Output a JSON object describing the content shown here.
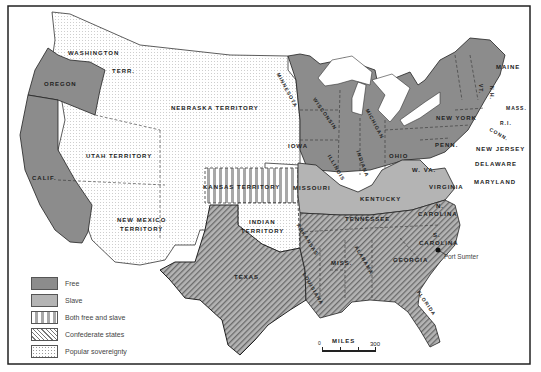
{
  "map": {
    "title": "United States 1854-1861 (Kansas-Nebraska Act era)",
    "legend": [
      {
        "key": "free",
        "label": "Free",
        "color": "#8c8c8c",
        "pattern": "solid"
      },
      {
        "key": "slave",
        "label": "Slave",
        "color": "#b4b4b4",
        "pattern": "solid"
      },
      {
        "key": "both",
        "label": "Both free and slave",
        "color": "#a8a8a8",
        "pattern": "vertical-stripes"
      },
      {
        "key": "confederate",
        "label": "Confederate states",
        "color": "#777777",
        "pattern": "diagonal-hatch"
      },
      {
        "key": "popular",
        "label": "Popular sovereignty",
        "color": "#999999",
        "pattern": "dots"
      }
    ],
    "scale": {
      "label": "MILES",
      "start": "0",
      "end": "300"
    },
    "annotation": {
      "label": "Fort Sumter"
    },
    "regions": {
      "washington": {
        "name": "WASHINGTON",
        "suffix": "TERR.",
        "status": "popular"
      },
      "oregon": {
        "name": "OREGON",
        "status": "free"
      },
      "california": {
        "name": "CALIF.",
        "status": "free"
      },
      "nebraska": {
        "name": "NEBRASKA TERRITORY",
        "status": "popular"
      },
      "utah": {
        "name": "UTAH TERRITORY",
        "status": "popular"
      },
      "new_mexico": {
        "name_line1": "NEW MEXICO",
        "name_line2": "TERRITORY",
        "status": "popular"
      },
      "kansas": {
        "name": "KANSAS TERRITORY",
        "status": "both"
      },
      "indian": {
        "name_line1": "INDIAN",
        "name_line2": "TERRITORY",
        "status": "popular"
      },
      "texas": {
        "name": "TEXAS",
        "status": "slave-confederate"
      },
      "minnesota": {
        "name": "MINNESOTA",
        "status": "free"
      },
      "iowa": {
        "name": "IOWA",
        "status": "free"
      },
      "missouri": {
        "name": "MISSOURI",
        "status": "slave"
      },
      "arkansas": {
        "name": "ARKANSAS",
        "status": "slave-confederate"
      },
      "louisiana": {
        "name": "LOUISIANA",
        "status": "slave-confederate"
      },
      "wisconsin": {
        "name": "WISCONSIN",
        "status": "free"
      },
      "illinois": {
        "name": "ILLINOIS",
        "status": "free"
      },
      "michigan": {
        "name": "MICHIGAN",
        "status": "free"
      },
      "indiana": {
        "name": "INDIANA",
        "status": "free"
      },
      "ohio": {
        "name": "OHIO",
        "status": "free"
      },
      "kentucky": {
        "name": "KENTUCKY",
        "status": "slave"
      },
      "tennessee": {
        "name": "TENNESSEE",
        "status": "slave-confederate"
      },
      "mississippi": {
        "name": "MISS.",
        "status": "slave-confederate"
      },
      "alabama": {
        "name": "ALABAMA",
        "status": "slave-confederate"
      },
      "georgia": {
        "name": "GEORGIA",
        "status": "slave-confederate"
      },
      "florida": {
        "name": "FLORIDA",
        "status": "slave-confederate"
      },
      "south_carolina": {
        "name_line1": "S.",
        "name_line2": "CAROLINA",
        "status": "slave-confederate"
      },
      "north_carolina": {
        "name_line1": "N.",
        "name_line2": "CAROLINA",
        "status": "slave-confederate"
      },
      "virginia": {
        "name": "VIRGINIA",
        "status": "slave-confederate"
      },
      "west_virginia": {
        "name": "W. VA.",
        "status": "slave"
      },
      "maryland": {
        "name": "MARYLAND",
        "status": "slave"
      },
      "delaware": {
        "name": "DELAWARE",
        "status": "slave"
      },
      "new_jersey": {
        "name": "NEW JERSEY",
        "status": "free"
      },
      "pennsylvania": {
        "name": "PENN.",
        "status": "free"
      },
      "new_york": {
        "name": "NEW YORK",
        "status": "free"
      },
      "vermont": {
        "name": "VT.",
        "status": "free"
      },
      "new_hampshire": {
        "name": "N.H.",
        "status": "free"
      },
      "massachusetts": {
        "name": "MASS.",
        "status": "free"
      },
      "rhode_island": {
        "name": "R.I.",
        "status": "free"
      },
      "connecticut": {
        "name": "CONN.",
        "status": "free"
      },
      "maine": {
        "name": "MAINE",
        "status": "free"
      }
    }
  }
}
